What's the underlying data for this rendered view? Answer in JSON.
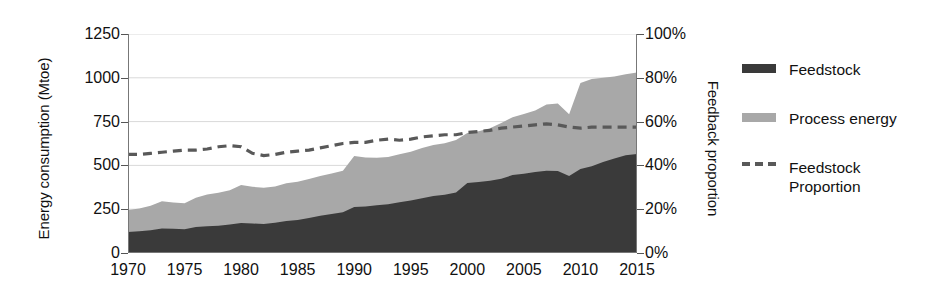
{
  "chart_data": {
    "type": "area",
    "title": "",
    "xlabel": "",
    "ylabel": "Energy consumption (Mtoe)",
    "ylabel_right": "Feedback proportion",
    "xlim": [
      1970,
      2015
    ],
    "ylim": [
      0,
      1250
    ],
    "ylim_right": [
      0,
      100
    ],
    "grid": true,
    "legend_position": "right",
    "yticks": [
      "1250",
      "1000",
      "750",
      "500",
      "250",
      "0"
    ],
    "ytick_values": [
      1250,
      1000,
      750,
      500,
      250,
      0
    ],
    "yticks_right": [
      "100%",
      "80%",
      "60%",
      "40%",
      "20%",
      "0%"
    ],
    "ytick_right_values": [
      100,
      80,
      60,
      40,
      20,
      0
    ],
    "xticks": [
      "1970",
      "1975",
      "1980",
      "1985",
      "1990",
      "1995",
      "2000",
      "2005",
      "2010",
      "2015"
    ],
    "xtick_values": [
      1970,
      1975,
      1980,
      1985,
      1990,
      1995,
      2000,
      2005,
      2010,
      2015
    ],
    "x": [
      1970,
      1971,
      1972,
      1973,
      1974,
      1975,
      1976,
      1977,
      1978,
      1979,
      1980,
      1981,
      1982,
      1983,
      1984,
      1985,
      1986,
      1987,
      1988,
      1989,
      1990,
      1991,
      1992,
      1993,
      1994,
      1995,
      1996,
      1997,
      1998,
      1999,
      2000,
      2001,
      2002,
      2003,
      2004,
      2005,
      2006,
      2007,
      2008,
      2009,
      2010,
      2011,
      2012,
      2013,
      2014,
      2015
    ],
    "series": [
      {
        "name": "Feedstock",
        "color": "#3a3a3a",
        "values": [
          120,
          124,
          130,
          140,
          138,
          136,
          148,
          152,
          156,
          162,
          171,
          168,
          166,
          172,
          183,
          189,
          200,
          212,
          222,
          232,
          262,
          265,
          272,
          278,
          290,
          300,
          312,
          325,
          332,
          345,
          400,
          405,
          412,
          424,
          445,
          452,
          462,
          470,
          468,
          440,
          480,
          495,
          520,
          540,
          558,
          565
        ]
      },
      {
        "name": "Process energy",
        "color": "#a8a8a8",
        "values": [
          125,
          130,
          140,
          155,
          150,
          148,
          168,
          182,
          188,
          196,
          217,
          210,
          206,
          208,
          215,
          218,
          222,
          228,
          232,
          238,
          292,
          280,
          272,
          270,
          274,
          278,
          288,
          292,
          295,
          300,
          285,
          290,
          300,
          318,
          330,
          342,
          352,
          378,
          385,
          352,
          490,
          498,
          480,
          468,
          462,
          465
        ]
      }
    ],
    "total_stacked": [
      245,
      254,
      270,
      295,
      288,
      284,
      316,
      334,
      344,
      358,
      388,
      378,
      372,
      380,
      398,
      407,
      422,
      440,
      454,
      470,
      554,
      545,
      544,
      548,
      564,
      578,
      600,
      617,
      627,
      645,
      685,
      695,
      712,
      742,
      775,
      794,
      814,
      848,
      853,
      792,
      970,
      993,
      1000,
      1008,
      1020,
      1030
    ],
    "line_series": {
      "name": "Feedstock Proportion",
      "color": "#595959",
      "style": "dashed",
      "axis": "right",
      "unit": "%",
      "values": [
        45,
        45,
        45.5,
        46,
        46.5,
        47,
        47,
        47.5,
        48.5,
        49,
        48.5,
        45.5,
        44.5,
        45,
        46,
        46.5,
        47,
        48,
        49,
        50,
        50.5,
        50.5,
        51.5,
        52,
        51.5,
        52,
        53,
        53.5,
        54,
        54,
        55,
        55.5,
        56,
        57,
        57.5,
        58,
        58.5,
        59,
        58.5,
        57.5,
        57,
        57.5,
        57.5,
        57.5,
        57.5,
        57.5
      ]
    }
  },
  "legend": {
    "items": [
      {
        "label": "Feedstock",
        "swatch": "filled",
        "color": "#3a3a3a"
      },
      {
        "label": "Process energy",
        "swatch": "filled",
        "color": "#a8a8a8"
      },
      {
        "label": "Feedstock\nProportion",
        "swatch": "dashed",
        "color": "#595959"
      }
    ]
  },
  "colors": {
    "feedstock": "#3a3a3a",
    "process_energy": "#a8a8a8",
    "proportion_line": "#595959",
    "grid": "#d9d9d9",
    "axis": "#555555",
    "background": "#ffffff"
  }
}
